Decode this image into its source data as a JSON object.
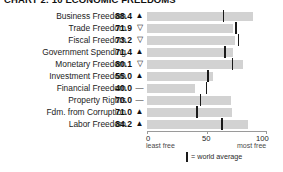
{
  "chart_data": {
    "type": "bar",
    "title": "CHART 2: 10 ECONOMIC FREEDOMS",
    "xlabel": "",
    "ylabel": "",
    "xlim": [
      0,
      100
    ],
    "x_ticks": [
      0,
      50,
      100
    ],
    "x_tick_labels": [
      "0",
      "50",
      "100"
    ],
    "axis_sub_left": "least free",
    "axis_sub_right": "most free",
    "grid": false,
    "orientation": "horizontal",
    "bar_color": "#d2d2d2",
    "marker_color": "#1a1a1a",
    "legend": {
      "marker_label": "= world average",
      "position": "bottom-center"
    },
    "categories": [
      "Business Freedom",
      "Trade Freedom",
      "Fiscal Freedom",
      "Government Spending",
      "Monetary Freedom",
      "Investment Freedom",
      "Financial Freedom",
      "Property Rights",
      "Fdm. from Corruption",
      "Labor Freedom"
    ],
    "values": [
      88.4,
      71.9,
      73.2,
      71.4,
      80.1,
      55.0,
      40.0,
      70.0,
      71.0,
      84.2
    ],
    "value_labels": [
      "88.4",
      "71.9",
      "73.2",
      "71.4",
      "80.1",
      "55.0",
      "40.0",
      "70.0",
      "71.0",
      "84.2"
    ],
    "trend": [
      "up",
      "down",
      "down",
      "up",
      "down",
      "up",
      "flat",
      "flat",
      "up",
      "up"
    ],
    "trend_glyphs": [
      "▲",
      "▽",
      "▽",
      "▲",
      "▽",
      "▲",
      "—",
      "—",
      "▲",
      "▲"
    ],
    "world_average": [
      63.0,
      73.5,
      75.5,
      64.5,
      70.5,
      50.0,
      49.0,
      44.0,
      41.0,
      62.0
    ],
    "series": [
      {
        "name": "Country score",
        "values": [
          88.4,
          71.9,
          73.2,
          71.4,
          80.1,
          55.0,
          40.0,
          70.0,
          71.0,
          84.2
        ]
      },
      {
        "name": "World average",
        "values": [
          63.0,
          73.5,
          75.5,
          64.5,
          70.5,
          50.0,
          49.0,
          44.0,
          41.0,
          62.0
        ]
      }
    ]
  }
}
